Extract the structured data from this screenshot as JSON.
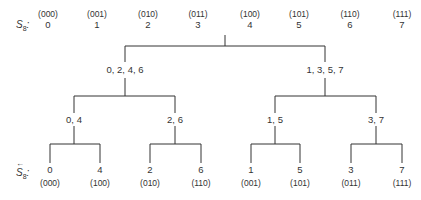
{
  "diagram": {
    "top_label": {
      "symbol": "S",
      "subscript": "8",
      "suffix": ":"
    },
    "bottom_label": {
      "symbol": "S",
      "subscript": "8",
      "suffix": ":",
      "accent": "←"
    },
    "top_row": [
      {
        "binary": "(000)",
        "value": "0"
      },
      {
        "binary": "(001)",
        "value": "1"
      },
      {
        "binary": "(010)",
        "value": "2"
      },
      {
        "binary": "(011)",
        "value": "3"
      },
      {
        "binary": "(100)",
        "value": "4"
      },
      {
        "binary": "(101)",
        "value": "5"
      },
      {
        "binary": "(110)",
        "value": "6"
      },
      {
        "binary": "(111)",
        "value": "7"
      }
    ],
    "level1": [
      "0, 2, 4, 6",
      "1, 3, 5, 7"
    ],
    "level2": [
      "0, 4",
      "2, 6",
      "1, 5",
      "3, 7"
    ],
    "leaves": [
      {
        "value": "0",
        "binary": "(000)"
      },
      {
        "value": "4",
        "binary": "(100)"
      },
      {
        "value": "2",
        "binary": "(010)"
      },
      {
        "value": "6",
        "binary": "(110)"
      },
      {
        "value": "1",
        "binary": "(001)"
      },
      {
        "value": "5",
        "binary": "(101)"
      },
      {
        "value": "3",
        "binary": "(011)"
      },
      {
        "value": "7",
        "binary": "(111)"
      }
    ],
    "line_color": "#333333"
  }
}
